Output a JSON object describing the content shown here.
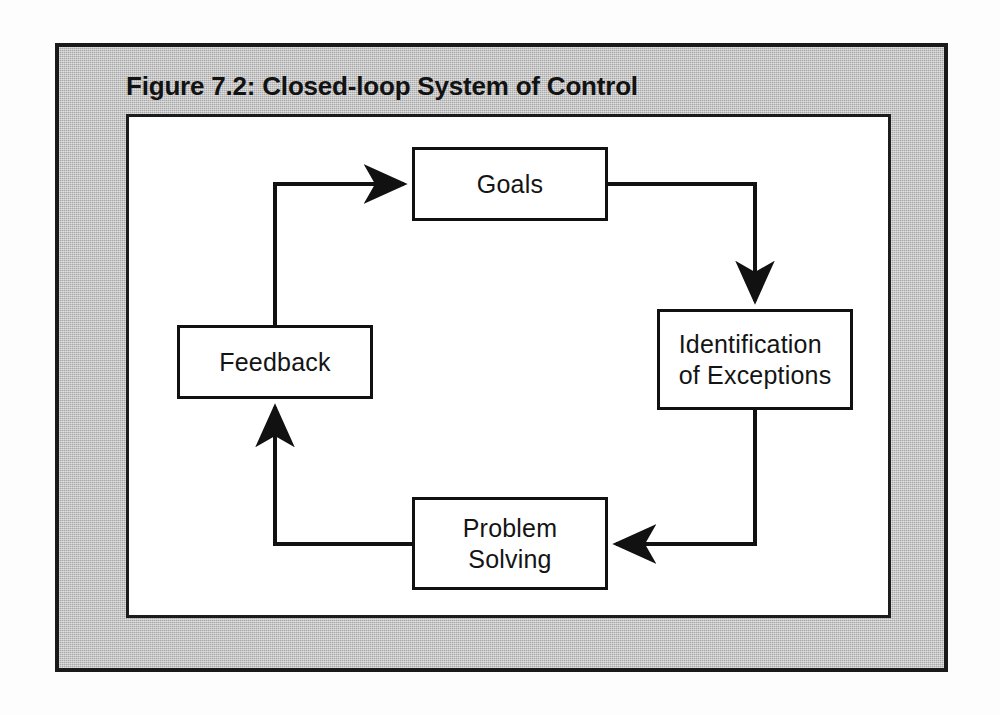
{
  "figure": {
    "title": "Figure 7.2: Closed-loop System of Control",
    "type": "closed-loop-cycle-diagram",
    "colors": {
      "plate_background": "#b9b9b9",
      "canvas_background": "#ffffff",
      "line": "#111111",
      "text": "#141414"
    }
  },
  "nodes": [
    {
      "id": "goals",
      "label": "Goals"
    },
    {
      "id": "identification",
      "label": "Identification\nof Exceptions"
    },
    {
      "id": "problem",
      "label": "Problem\nSolving"
    },
    {
      "id": "feedback",
      "label": "Feedback"
    }
  ],
  "edges": [
    {
      "from": "goals",
      "to": "identification",
      "direction": "down",
      "arrow": "into-identification-top"
    },
    {
      "from": "identification",
      "to": "problem",
      "direction": "left",
      "arrow": "into-problem-right"
    },
    {
      "from": "problem",
      "to": "feedback",
      "direction": "up",
      "arrow": "into-feedback-bottom"
    },
    {
      "from": "feedback",
      "to": "goals",
      "direction": "right",
      "arrow": "into-goals-left"
    }
  ]
}
